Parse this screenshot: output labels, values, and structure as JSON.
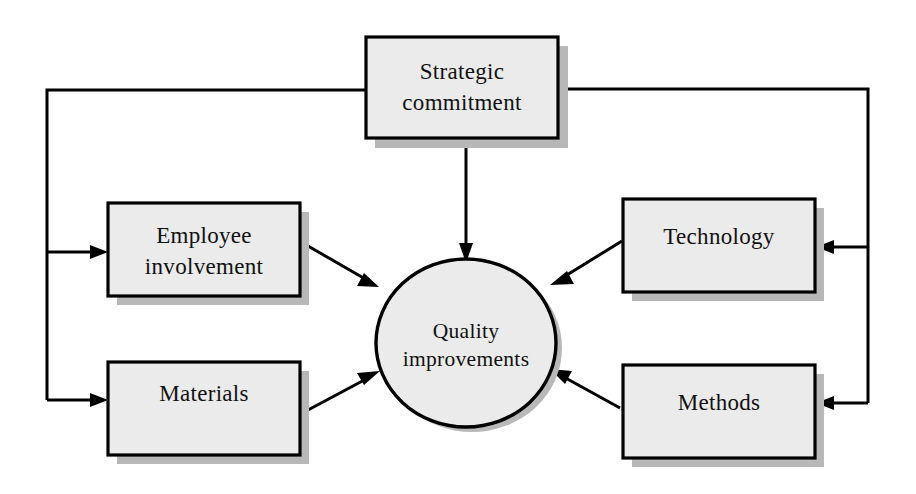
{
  "diagram": {
    "type": "hub-and-spoke-feedback",
    "colors": {
      "node_fill": "#ebebeb",
      "node_stroke": "#000000",
      "shadow": "#b8b8b8",
      "background": "#ffffff",
      "text": "#111111"
    },
    "center": {
      "id": "quality-improvements",
      "shape": "ellipse",
      "line1": "Quality",
      "line2": "improvements"
    },
    "nodes": [
      {
        "id": "strategic-commitment",
        "shape": "rectangle",
        "position": "top-center",
        "line1": "Strategic",
        "line2": "commitment"
      },
      {
        "id": "employee-involvement",
        "shape": "rectangle",
        "position": "left-upper",
        "line1": "Employee",
        "line2": "involvement"
      },
      {
        "id": "materials",
        "shape": "rectangle",
        "position": "left-lower",
        "line1": "Materials",
        "line2": ""
      },
      {
        "id": "technology",
        "shape": "rectangle",
        "position": "right-upper",
        "line1": "Technology",
        "line2": ""
      },
      {
        "id": "methods",
        "shape": "rectangle",
        "position": "right-lower",
        "line1": "Methods",
        "line2": ""
      }
    ],
    "connections": [
      {
        "id": "strategic-to-quality",
        "from": "strategic-commitment",
        "to": "quality-improvements",
        "style": "straight-vertical",
        "arrow": "to"
      },
      {
        "id": "employee-to-quality",
        "from": "employee-involvement",
        "to": "quality-improvements",
        "style": "diagonal",
        "arrow": "to"
      },
      {
        "id": "materials-to-quality",
        "from": "materials",
        "to": "quality-improvements",
        "style": "diagonal",
        "arrow": "to"
      },
      {
        "id": "technology-to-quality",
        "from": "technology",
        "to": "quality-improvements",
        "style": "diagonal",
        "arrow": "to"
      },
      {
        "id": "methods-to-quality",
        "from": "methods",
        "to": "quality-improvements",
        "style": "diagonal",
        "arrow": "to"
      },
      {
        "id": "strategic-to-employee",
        "from": "strategic-commitment",
        "to": "employee-involvement",
        "style": "orthogonal-left-bus",
        "arrow": "to"
      },
      {
        "id": "strategic-to-materials",
        "from": "strategic-commitment",
        "to": "materials",
        "style": "orthogonal-left-bus",
        "arrow": "to"
      },
      {
        "id": "strategic-to-technology",
        "from": "strategic-commitment",
        "to": "technology",
        "style": "orthogonal-right-bus",
        "arrow": "to"
      },
      {
        "id": "strategic-to-methods",
        "from": "strategic-commitment",
        "to": "methods",
        "style": "orthogonal-right-bus",
        "arrow": "to"
      }
    ]
  }
}
